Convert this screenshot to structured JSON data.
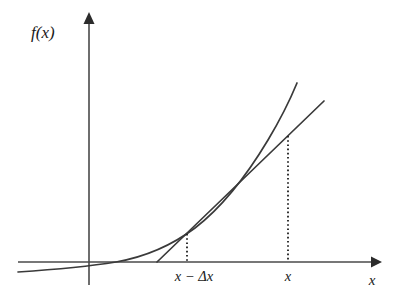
{
  "figure": {
    "background_color": "#ffffff",
    "line_color": "#3a3a3a",
    "axis_color": "#4a4a4a",
    "label_color": "#1a1a1a",
    "axes": {
      "y_axis_label": "f(x)",
      "x_axis_label": "x",
      "y_axis_x_px": 89,
      "y_axis_top_px": 15,
      "y_axis_bottom_px": 285,
      "x_axis_y_px": 262,
      "x_axis_left_px": 18,
      "x_axis_right_px": 378,
      "arrowheads": [
        "y-axis-up",
        "x-axis-right"
      ]
    },
    "tick_labels": [
      {
        "name": "x-minus-delta-x",
        "text": "x − Δx",
        "x_px": 194,
        "y_px": 281
      },
      {
        "name": "x",
        "text": "x",
        "x_px": 288,
        "y_px": 281
      }
    ],
    "points": [
      {
        "name": "left-intersection",
        "x_px": 187,
        "y_px": 233,
        "tick_label": "x − Δx"
      },
      {
        "name": "right-intersection",
        "x_px": 288,
        "y_px": 135,
        "tick_label": "x"
      }
    ],
    "drop_lines": [
      {
        "name": "drop-line-x-minus-delta-x",
        "x_px": 187,
        "y_top_px": 234,
        "y_bottom_px": 262,
        "style": "dotted"
      },
      {
        "name": "drop-line-x",
        "x_px": 288,
        "y_top_px": 136,
        "y_bottom_px": 262,
        "style": "dotted"
      }
    ],
    "curve": {
      "name": "function-curve",
      "shape": "increasing convex exponential-like",
      "start_px": [
        18,
        272
      ],
      "end_px": [
        297,
        83
      ],
      "crosses_x_axis_px": [
        116,
        262
      ]
    },
    "secant": {
      "name": "secant-line",
      "description": "chord through the two marked curve points, extended at both ends",
      "start_px": [
        157,
        262
      ],
      "end_px": [
        324,
        101
      ]
    }
  }
}
